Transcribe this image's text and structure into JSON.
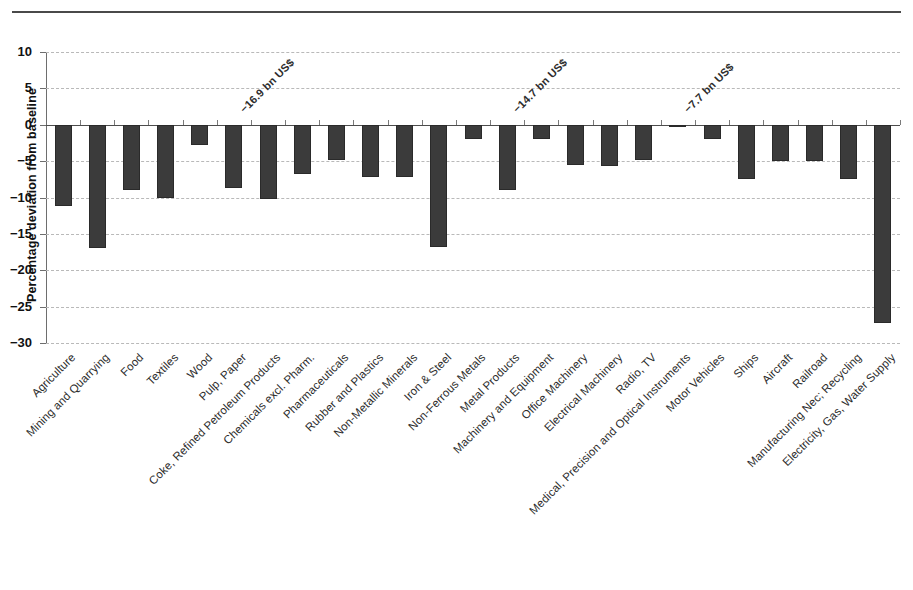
{
  "figure": {
    "title_fragment": "",
    "background": "#ffffff",
    "bar_color": "#3b3b3b",
    "grid_color": "#b9b9b9",
    "axis_color": "#6e6e6e"
  },
  "chart_data": {
    "type": "bar",
    "title": "",
    "subtitle": "",
    "xlabel": "",
    "ylabel": "Percentage deviation from baseline",
    "ylim": [
      -30,
      10
    ],
    "yticks": [
      10,
      5,
      0,
      -5,
      -10,
      -15,
      -20,
      -25,
      -30
    ],
    "ytick_labels": [
      "10",
      "5",
      "0",
      "−5",
      "−10",
      "−15",
      "−20",
      "−25",
      "−30"
    ],
    "grid": true,
    "grid_axis": "y",
    "legend": null,
    "legend_position": "none",
    "orientation": "vertical",
    "categories": [
      "Agriculture",
      "Mining and Quarrying",
      "Food",
      "Textiles",
      "Wood",
      "Pulp, Paper",
      "Coke, Refined Petroleum Products",
      "Chemicals excl. Pharm.",
      "Pharmaceuticals",
      "Rubber and Plastics",
      "Non-Metallic Minerals",
      "Iron & Steel",
      "Non-Ferrous Metals",
      "Metal Products",
      "Machinery and Equipment",
      "Office Machinery",
      "Electrical Machinery",
      "Radio, TV",
      "Medical, Precision and Optical Instruments",
      "Motor Vehicles",
      "Ships",
      "Aircraft",
      "Railroad",
      "Manufacturing Nec; Recycling",
      "Electricity, Gas, Water Supply"
    ],
    "values": [
      -11.2,
      -17.0,
      -9.0,
      -10.1,
      -2.8,
      -8.7,
      -10.2,
      -6.8,
      -4.8,
      -7.2,
      -7.2,
      -16.8,
      -2.0,
      -9.0,
      -2.0,
      -5.6,
      -5.7,
      -4.8,
      -0.3,
      -2.0,
      -7.5,
      -5.0,
      -5.0,
      -7.5,
      -27.3
    ],
    "annotations": [
      {
        "text": "−16.9 bn US$",
        "category": "Coke, Refined Petroleum Products"
      },
      {
        "text": "−14.7 bn US$",
        "category": "Machinery and Equipment"
      },
      {
        "text": "−7.7 bn US$",
        "category": "Motor Vehicles"
      }
    ]
  }
}
